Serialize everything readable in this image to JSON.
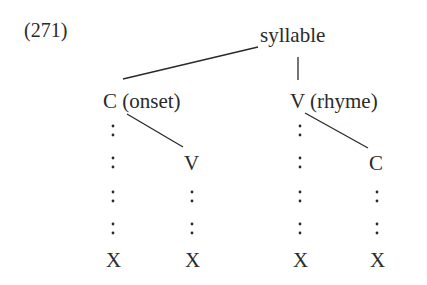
{
  "example_number": "(271)",
  "nodes": {
    "root": "syllable",
    "onset": "C (onset)",
    "rhyme": "V (rhyme)",
    "onset_child": "V",
    "rhyme_child": "C",
    "x_slots": [
      "X",
      "X",
      "X",
      "X"
    ]
  },
  "colors": {
    "ink": "#2a2a2a",
    "background": "#ffffff"
  }
}
